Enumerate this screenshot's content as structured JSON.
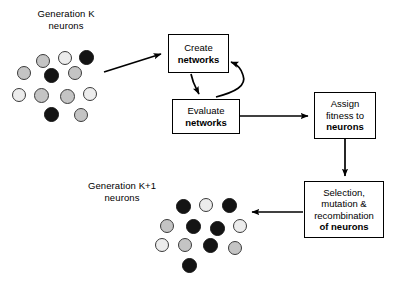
{
  "diagram": {
    "colors": {
      "stroke": "#000000",
      "neuron_dark": "#141414",
      "neuron_mid": "#c4c4c4",
      "neuron_light": "#ececec",
      "neuron_outline": "#3a3a3a",
      "background": "#ffffff"
    },
    "labels": {
      "generation_k": "Generation K\nneurons",
      "generation_k_plus_1": "Generation K+1\nneurons"
    },
    "boxes": [
      {
        "id": "create",
        "name": "create-networks-box",
        "lines": [
          {
            "text": "Create",
            "bold": false
          },
          {
            "text": "networks",
            "bold": true
          }
        ]
      },
      {
        "id": "evaluate",
        "name": "evaluate-networks-box",
        "lines": [
          {
            "text": "Evaluate",
            "bold": false
          },
          {
            "text": "networks",
            "bold": true
          }
        ]
      },
      {
        "id": "assign",
        "name": "assign-fitness-box",
        "lines": [
          {
            "text": "Assign",
            "bold": false
          },
          {
            "text": "fitness to",
            "bold": false
          },
          {
            "text": "neurons",
            "bold": true
          }
        ]
      },
      {
        "id": "selection",
        "name": "selection-mutation-box",
        "lines": [
          {
            "text": "Selection,",
            "bold": false
          },
          {
            "text": "mutation &",
            "bold": false
          },
          {
            "text": "recombination",
            "bold": false
          },
          {
            "text": "of neurons",
            "bold": true
          }
        ]
      }
    ],
    "arrows": [
      {
        "name": "arrow-genk-to-create",
        "kind": "straight"
      },
      {
        "name": "arrow-create-to-evaluate",
        "kind": "straight"
      },
      {
        "name": "arrow-evaluate-to-create-feedback",
        "kind": "curved"
      },
      {
        "name": "arrow-evaluate-to-assign",
        "kind": "straight"
      },
      {
        "name": "arrow-assign-to-selection",
        "kind": "straight"
      },
      {
        "name": "arrow-selection-to-genk1",
        "kind": "straight"
      }
    ],
    "clusters": [
      {
        "id": "generation-k",
        "name": "generation-k-neuron-cluster",
        "count": 12,
        "neurons": [
          {
            "x": 36,
            "y": 54,
            "d": 14,
            "shade": "mid"
          },
          {
            "x": 58,
            "y": 51,
            "d": 14,
            "shade": "light"
          },
          {
            "x": 79,
            "y": 50,
            "d": 15,
            "shade": "dark"
          },
          {
            "x": 17,
            "y": 66,
            "d": 14,
            "shade": "mid"
          },
          {
            "x": 44,
            "y": 68,
            "d": 15,
            "shade": "dark"
          },
          {
            "x": 68,
            "y": 66,
            "d": 14,
            "shade": "mid"
          },
          {
            "x": 12,
            "y": 88,
            "d": 14,
            "shade": "light"
          },
          {
            "x": 34,
            "y": 88,
            "d": 15,
            "shade": "mid"
          },
          {
            "x": 60,
            "y": 89,
            "d": 15,
            "shade": "mid"
          },
          {
            "x": 83,
            "y": 87,
            "d": 14,
            "shade": "light"
          },
          {
            "x": 44,
            "y": 107,
            "d": 15,
            "shade": "dark"
          },
          {
            "x": 74,
            "y": 108,
            "d": 14,
            "shade": "mid"
          }
        ]
      },
      {
        "id": "generation-k-plus-1",
        "name": "generation-k-plus-1-neuron-cluster",
        "count": 12,
        "neurons": [
          {
            "x": 176,
            "y": 199,
            "d": 15,
            "shade": "dark"
          },
          {
            "x": 199,
            "y": 198,
            "d": 14,
            "shade": "light"
          },
          {
            "x": 222,
            "y": 198,
            "d": 15,
            "shade": "dark"
          },
          {
            "x": 160,
            "y": 219,
            "d": 14,
            "shade": "mid"
          },
          {
            "x": 186,
            "y": 219,
            "d": 15,
            "shade": "dark"
          },
          {
            "x": 210,
            "y": 221,
            "d": 15,
            "shade": "dark"
          },
          {
            "x": 233,
            "y": 219,
            "d": 14,
            "shade": "light"
          },
          {
            "x": 155,
            "y": 238,
            "d": 14,
            "shade": "light"
          },
          {
            "x": 178,
            "y": 238,
            "d": 14,
            "shade": "mid"
          },
          {
            "x": 203,
            "y": 238,
            "d": 15,
            "shade": "dark"
          },
          {
            "x": 228,
            "y": 241,
            "d": 14,
            "shade": "mid"
          },
          {
            "x": 182,
            "y": 258,
            "d": 15,
            "shade": "dark"
          }
        ]
      }
    ]
  }
}
